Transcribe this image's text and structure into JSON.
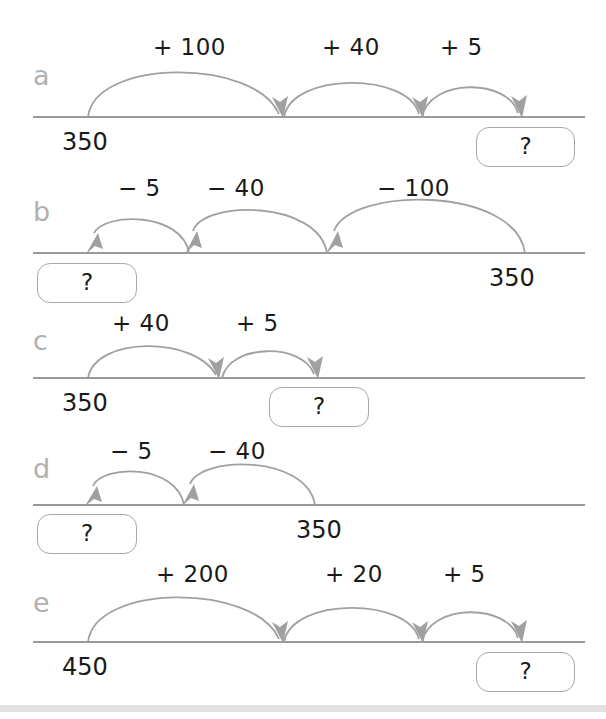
{
  "page": {
    "background_color": "#ffffff",
    "line_color": "#9a9a9a",
    "arc_color": "#a0a0a0",
    "letter_color": "#b0b0b0",
    "text_color": "#1a1a1a",
    "box_border_color": "#a8a8a8",
    "bottom_bar_color": "#e2e2e2"
  },
  "question_mark": "?",
  "rows": [
    {
      "letter": "a",
      "start_label": "350",
      "end_label": "?",
      "answer_position": "right",
      "direction": "right",
      "jumps": [
        "+ 100",
        "+ 40",
        "+ 5"
      ]
    },
    {
      "letter": "b",
      "start_label": "350",
      "end_label": "?",
      "answer_position": "left",
      "direction": "left",
      "jumps": [
        "− 5",
        "− 40",
        "− 100"
      ]
    },
    {
      "letter": "c",
      "start_label": "350",
      "end_label": "?",
      "answer_position": "middle",
      "direction": "right",
      "jumps": [
        "+ 40",
        "+ 5"
      ]
    },
    {
      "letter": "d",
      "start_label": "350",
      "end_label": "?",
      "answer_position": "left",
      "direction": "left",
      "jumps": [
        "− 5",
        "− 40"
      ]
    },
    {
      "letter": "e",
      "start_label": "450",
      "end_label": "?",
      "answer_position": "right",
      "direction": "right",
      "jumps": [
        "+ 200",
        "+ 20",
        "+ 5"
      ]
    }
  ],
  "row_a": {
    "letter": "a",
    "jump1": "+ 100",
    "jump2": "+ 40",
    "jump3": "+ 5",
    "start": "350",
    "answer": "?"
  },
  "row_b": {
    "letter": "b",
    "jump1": "− 5",
    "jump2": "− 40",
    "jump3": "− 100",
    "start": "350",
    "answer": "?"
  },
  "row_c": {
    "letter": "c",
    "jump1": "+ 40",
    "jump2": "+ 5",
    "start": "350",
    "answer": "?"
  },
  "row_d": {
    "letter": "d",
    "jump1": "− 5",
    "jump2": "− 40",
    "start": "350",
    "answer": "?"
  },
  "row_e": {
    "letter": "e",
    "jump1": "+ 200",
    "jump2": "+ 20",
    "jump3": "+ 5",
    "start": "450",
    "answer": "?"
  }
}
